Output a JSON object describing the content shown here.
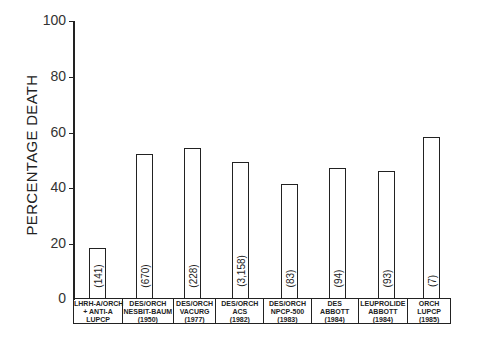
{
  "chart_data": {
    "type": "bar",
    "title": "",
    "xlabel": "",
    "ylabel": "PERCENTAGE DEATH",
    "ylim": [
      0,
      100
    ],
    "yticks": [
      "0",
      "20",
      "40",
      "60",
      "80",
      "100"
    ],
    "grid": false,
    "legend": null,
    "categories": [
      [
        "LHRH-A/ORCH",
        "+ ANTI-A",
        "LUPCP"
      ],
      [
        "DES/ORCH",
        "NESBIT-BAUM",
        "(1950)"
      ],
      [
        "DES/ORCH",
        "VACURG",
        "(1977)"
      ],
      [
        "DES/ORCH",
        "ACS",
        "(1982)"
      ],
      [
        "DES/ORCH",
        "NPCP-500",
        "(1983)"
      ],
      [
        "DES",
        "ABBOTT",
        "(1984)"
      ],
      [
        "LEUPROLIDE",
        "ABBOTT",
        "(1984)"
      ],
      [
        "ORCH",
        "LUPCP",
        "(1985)"
      ]
    ],
    "values": [
      18,
      52,
      54,
      49,
      41,
      47,
      46,
      58
    ],
    "n_labels": [
      "(141)",
      "(670)",
      "(228)",
      "(3,158)",
      "(83)",
      "(94)",
      "(93)",
      "(7)"
    ]
  }
}
